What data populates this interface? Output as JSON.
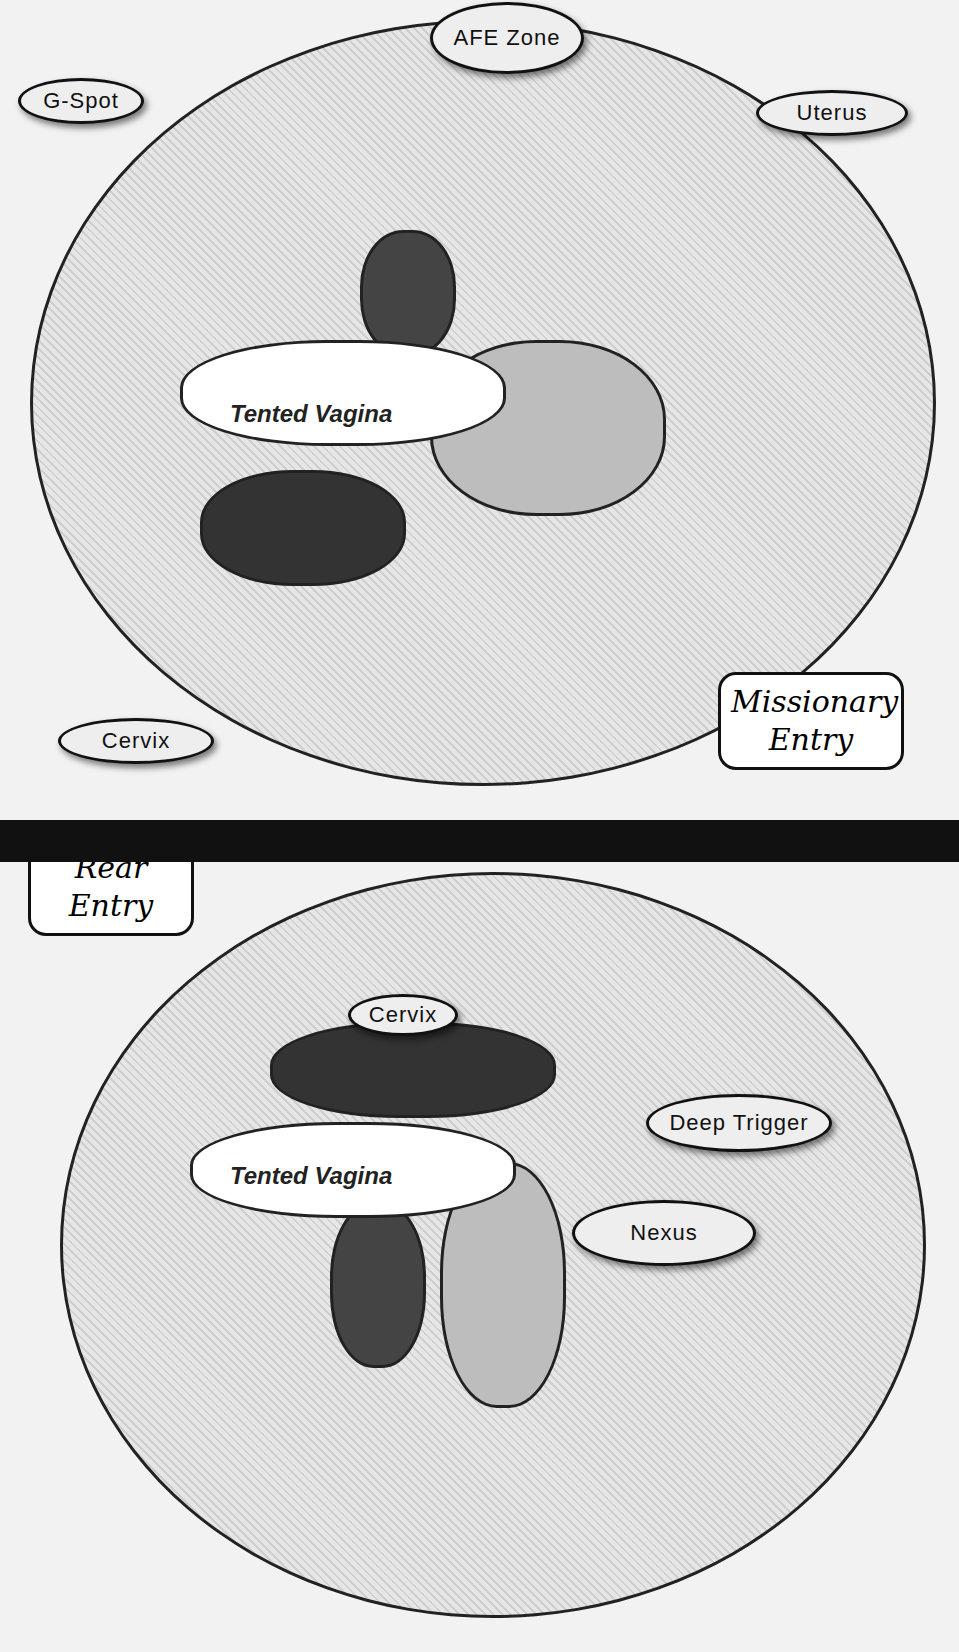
{
  "top_panel": {
    "caption_line1": "Missionary",
    "caption_line2": "Entry",
    "callouts": [
      "G-Spot",
      "AFE Zone",
      "Uterus",
      "Cervix"
    ],
    "structure_labels": [
      "Clitoris",
      "Labium Majus",
      "Symphysis",
      "Bladder",
      "Rectum",
      "Tented Vagina"
    ]
  },
  "bottom_panel": {
    "caption_line1": "Rear",
    "caption_line2": "Entry",
    "callouts": [
      "Cervix",
      "Deep Trigger",
      "Nexus"
    ],
    "structure_labels": [
      "Clitoris",
      "Labium Majus",
      "Symphysis",
      "Bladder",
      "Rectum",
      "Tented Vagina"
    ]
  }
}
